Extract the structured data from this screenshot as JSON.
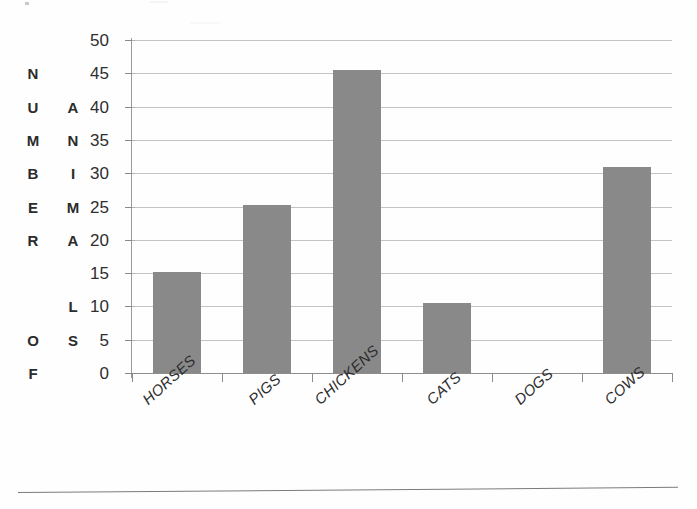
{
  "chart_data": {
    "type": "bar",
    "title": "",
    "xlabel": "",
    "ylabel": "NUMBER OF ANIMALS",
    "ylabel_columns": [
      {
        "text": "NUMBER OF",
        "letters": [
          "N",
          "U",
          "M",
          "B",
          "E",
          "R",
          "",
          "",
          "O",
          "F"
        ]
      },
      {
        "text": "ANIMALS",
        "letters": [
          "",
          "A",
          "N",
          "I",
          "M",
          "A",
          "",
          "L",
          "S",
          ""
        ]
      }
    ],
    "categories": [
      "HORSES",
      "PIGS",
      "CHICKENS",
      "CATS",
      "DOGS",
      "COWS"
    ],
    "values": [
      15.2,
      25.3,
      45.5,
      10.5,
      0,
      31
    ],
    "ylim": [
      0,
      50
    ],
    "ytick_labels": [
      "50",
      "45",
      "40",
      "35",
      "30",
      "25",
      "20",
      "15",
      "10",
      "5",
      "0"
    ],
    "ytick_values": [
      50,
      45,
      40,
      35,
      30,
      25,
      20,
      15,
      10,
      5,
      0
    ],
    "ytick_step": 5,
    "grid": true,
    "legend": false,
    "bar_color": "#898989",
    "gridline_color": "#b9b9b9",
    "axis_color": "#8a8a8a",
    "text_color": "#2d2d2d",
    "background_color": "#ffffff",
    "xlabel_rotation_deg": -42
  }
}
